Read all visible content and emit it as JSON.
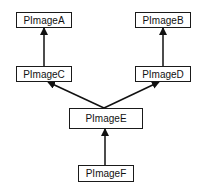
{
  "diagram": {
    "type": "inheritance-hierarchy",
    "nodes": [
      {
        "id": "A",
        "label": "PImageA"
      },
      {
        "id": "B",
        "label": "PImageB"
      },
      {
        "id": "C",
        "label": "PImageC"
      },
      {
        "id": "D",
        "label": "PImageD"
      },
      {
        "id": "E",
        "label": "PImageE"
      },
      {
        "id": "F",
        "label": "PImageF"
      }
    ],
    "edges": [
      {
        "from": "C",
        "to": "A"
      },
      {
        "from": "D",
        "to": "B"
      },
      {
        "from": "E",
        "to": "C"
      },
      {
        "from": "E",
        "to": "D"
      },
      {
        "from": "F",
        "to": "E"
      }
    ]
  }
}
